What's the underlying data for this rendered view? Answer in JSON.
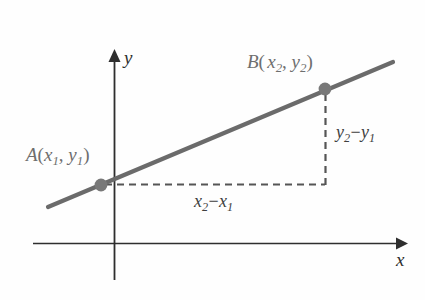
{
  "figure": {
    "background_color": "#fefefe",
    "line_color": "#6b6b6b",
    "axis_color": "#2e2e2e",
    "dash_color": "#555555",
    "point_color": "#787878"
  },
  "axes": {
    "y_label": "y",
    "x_label": "x",
    "y_axis_top": 52,
    "y_axis_bottom": 280,
    "y_axis_x": 114,
    "x_axis_left": 33,
    "x_axis_right": 405,
    "x_axis_y": 243
  },
  "points": {
    "a": {
      "name": "A",
      "label_name": "A",
      "label_open": "(",
      "label_x": "x",
      "label_x_sub": "1",
      "label_comma": ", ",
      "label_y": "y",
      "label_y_sub": "1",
      "label_close": ")",
      "label_full": "A (x1, y1)",
      "cx": 101,
      "cy": 185
    },
    "b": {
      "name": "B",
      "label_name": "B",
      "label_open": "(",
      "label_x": "x",
      "label_x_sub": "2",
      "label_comma": ", ",
      "label_y": "y",
      "label_y_sub": "2",
      "label_close": ")",
      "label_full": "B (x2, y2)",
      "cx": 325,
      "cy": 89
    }
  },
  "annotations": {
    "rise": {
      "var": "y",
      "sub_hi": "2",
      "operator": "−",
      "sub_lo": "1",
      "full": "y2 - y1"
    },
    "run": {
      "var": "x",
      "sub_hi": "2",
      "operator": "−",
      "sub_lo": "1",
      "full": "x2 - x1"
    }
  },
  "geometry": {
    "line_start_x": 48,
    "line_start_y": 207,
    "line_end_x": 393,
    "line_end_y": 62,
    "dash_h_start_x": 105,
    "dash_h_end_x": 325,
    "dash_h_y": 184,
    "dash_v_x": 325,
    "dash_v_start_y": 94,
    "dash_v_end_y": 185
  }
}
